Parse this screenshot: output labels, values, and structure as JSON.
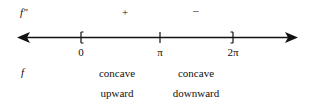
{
  "diagram": {
    "row_labels": {
      "second_derivative": "f″",
      "function": "f"
    },
    "number_line": {
      "ticks": [
        {
          "label": "0",
          "marker": "[",
          "x": 81
        },
        {
          "label": "π",
          "marker": "|",
          "x": 160
        },
        {
          "label": "2π",
          "marker": "]",
          "x": 233
        }
      ],
      "arrows": "both"
    },
    "intervals": [
      {
        "sign": "+",
        "concavity_line1": "concave",
        "concavity_line2": "upward"
      },
      {
        "sign": "–",
        "concavity_line1": "concave",
        "concavity_line2": "downward"
      }
    ]
  }
}
